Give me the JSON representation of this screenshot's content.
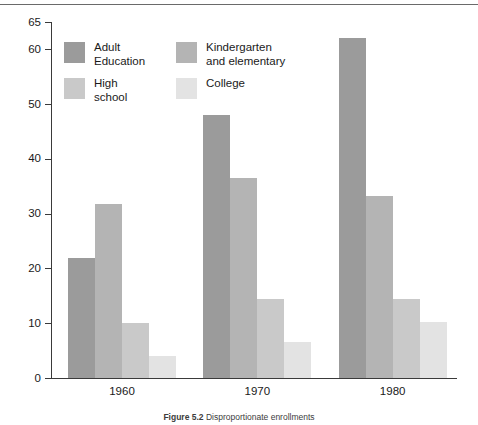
{
  "figure": {
    "caption_label": "Figure 5.2",
    "caption_body": "Disproportionate enrollments",
    "caption_full": "Figure 5.2 Disproportionate enrollments"
  },
  "legend": {
    "items": [
      {
        "label": "Adult\nEducation",
        "color": "#9b9b9b",
        "name": "adult-education"
      },
      {
        "label": "Kindergarten\nand elementary",
        "color": "#b4b4b4",
        "name": "kindergarten-and-elementary"
      },
      {
        "label": "High\nschool",
        "color": "#c9c9c9",
        "name": "high-school"
      },
      {
        "label": "College",
        "color": "#e3e3e3",
        "name": "college"
      }
    ]
  },
  "chart_data": {
    "type": "bar",
    "title": "Disproportionate enrollments",
    "xlabel": "",
    "ylabel": "",
    "categories": [
      "1960",
      "1970",
      "1980"
    ],
    "series": [
      {
        "name": "Adult Education",
        "color": "#9b9b9b",
        "values": [
          22,
          48,
          62
        ]
      },
      {
        "name": "Kindergarten and elementary",
        "color": "#b4b4b4",
        "values": [
          31.8,
          36.5,
          33.2
        ]
      },
      {
        "name": "High school",
        "color": "#c9c9c9",
        "values": [
          10,
          14.5,
          14.5
        ]
      },
      {
        "name": "College",
        "color": "#e3e3e3",
        "values": [
          4,
          6.5,
          10.2
        ]
      }
    ],
    "ylim": [
      0,
      65
    ],
    "yticks": [
      0,
      10,
      20,
      30,
      40,
      50,
      60,
      65
    ],
    "ytick_labels": [
      "0",
      "10",
      "20",
      "30",
      "40",
      "50",
      "60",
      "65"
    ],
    "grid": false,
    "legend_position": "upper-left-inside"
  }
}
